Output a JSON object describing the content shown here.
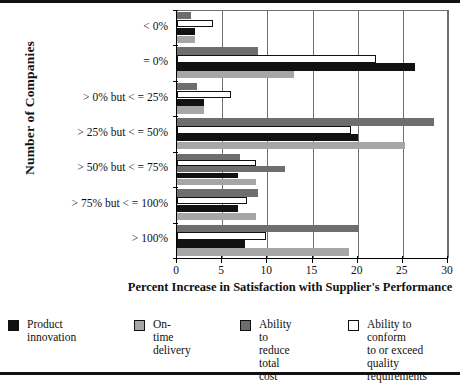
{
  "chart_data": {
    "type": "bar",
    "orientation": "horizontal",
    "title": "",
    "xlabel": "Percent Increase in Satisfaction with Supplier's Performance",
    "ylabel": "Number of Companies",
    "categories": [
      "< 0%",
      "= 0%",
      "> 0% but < = 25%",
      "> 25% but < = 50%",
      "> 50% but < = 75%",
      "> 75% but < = 100%",
      "> 100%"
    ],
    "xlim": [
      0,
      30
    ],
    "xticks": [
      0,
      5,
      10,
      15,
      20,
      25,
      30
    ],
    "xtick_labels": [
      "0",
      "5",
      "10",
      "15",
      "20",
      "25",
      "30"
    ],
    "grid": true,
    "legend_position": "below",
    "series": [
      {
        "name": "Ability to reduce total cost",
        "color": "#6e6e6e",
        "values": [
          1.5,
          9.0,
          2.2,
          28.5,
          7.0,
          9.0,
          20.0
        ]
      },
      {
        "name": "Ability to conform to or exceed quality requirements",
        "color": "#ffffff",
        "values": [
          4.0,
          22.0,
          6.0,
          19.3,
          8.8,
          7.7,
          9.8
        ]
      },
      {
        "name": "Product innovation",
        "color": "#111111",
        "values": [
          2.0,
          26.3,
          3.0,
          20.0,
          6.7,
          6.7,
          7.5
        ]
      },
      {
        "name": "On-time delivery",
        "color": "#a6a6a6",
        "values": [
          2.0,
          13.0,
          3.0,
          25.2,
          8.8,
          8.8,
          19.0
        ]
      }
    ],
    "extra_bars": [
      {
        "category": "> 50% but < = 75%",
        "series": "Ability to reduce total cost",
        "value": 12.0,
        "note": "second dark-gray bar in the > 50% but < = 75% group"
      }
    ]
  },
  "legend": {
    "items": [
      {
        "label": "Product\ninnovation",
        "swatch": "black-swatch",
        "color": "#111111"
      },
      {
        "label": "On-time delivery",
        "swatch": "light-gray-swatch",
        "color": "#a6a6a6"
      },
      {
        "label": "Ability to reduce\ntotal cost",
        "swatch": "dark-gray-swatch",
        "color": "#6e6e6e"
      },
      {
        "label": "Ability to conform\nto or exceed\nquality requirements",
        "swatch": "white-swatch",
        "color": "#ffffff"
      }
    ]
  }
}
